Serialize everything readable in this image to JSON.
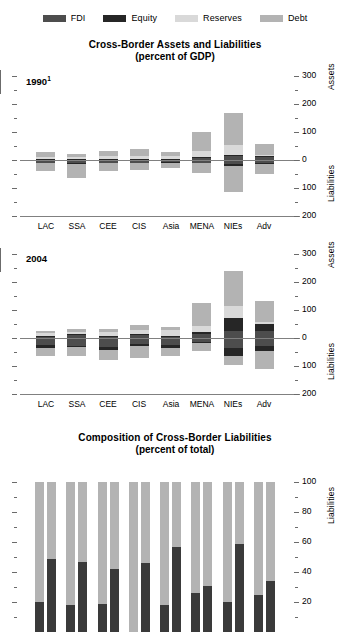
{
  "legend": {
    "items": [
      {
        "label": "FDI",
        "color": "#4d4d4d"
      },
      {
        "label": "Equity",
        "color": "#262626"
      },
      {
        "label": "Reserves",
        "color": "#d9d9d9"
      },
      {
        "label": "Debt",
        "color": "#b3b3b3"
      }
    ]
  },
  "chart_data": [
    {
      "type": "bar",
      "id": "assets-liabilities-1990",
      "title": "Cross-Border Assets and Liabilities",
      "subtitle": "(percent of GDP)",
      "panel_label": "1990",
      "panel_label_superscript": "1",
      "xlabel": "",
      "ylabel": "",
      "ylim": [
        -200,
        300
      ],
      "yticks": [
        -200,
        -100,
        0,
        100,
        200,
        300
      ],
      "ytick_labels": [
        "200",
        "100",
        "0",
        "100",
        "200",
        "300"
      ],
      "yminor_step": 50,
      "axis_side_labels": {
        "upper": "Assets",
        "lower": "Liabilities"
      },
      "grid": false,
      "legend_position": "top",
      "stacked": true,
      "categories": [
        "LAC",
        "SSA",
        "CEE",
        "CIS",
        "Asia",
        "MENA",
        "NIEs",
        "Adv"
      ],
      "series": [
        {
          "name": "FDI",
          "color": "#4d4d4d",
          "values_assets": [
            3,
            3,
            3,
            3,
            3,
            9,
            14,
            9
          ]
        },
        {
          "name": "Equity",
          "color": "#262626",
          "values_assets": [
            2,
            2,
            2,
            2,
            2,
            3,
            5,
            4
          ]
        },
        {
          "name": "Reserves",
          "color": "#d9d9d9",
          "values_assets": [
            7,
            5,
            8,
            9,
            9,
            19,
            36,
            6
          ]
        },
        {
          "name": "Debt",
          "color": "#b3b3b3",
          "values_assets": [
            16,
            13,
            20,
            24,
            16,
            69,
            113,
            38
          ]
        },
        {
          "name": "FDI",
          "color": "#4d4d4d",
          "values_liabilities": [
            9,
            12,
            9,
            9,
            7,
            9,
            16,
            9
          ]
        },
        {
          "name": "Equity",
          "color": "#262626",
          "values_liabilities": [
            3,
            3,
            3,
            2,
            3,
            3,
            6,
            4
          ]
        },
        {
          "name": "Debt",
          "color": "#b3b3b3",
          "values_liabilities": [
            26,
            49,
            29,
            26,
            18,
            34,
            92,
            37
          ]
        }
      ]
    },
    {
      "type": "bar",
      "id": "assets-liabilities-2004",
      "title": "Cross-Border Assets and Liabilities",
      "subtitle": "(percent of GDP)",
      "panel_label": "2004",
      "panel_label_superscript": "",
      "xlabel": "",
      "ylabel": "",
      "ylim": [
        -200,
        300
      ],
      "yticks": [
        -200,
        -100,
        0,
        100,
        200,
        300
      ],
      "ytick_labels": [
        "200",
        "100",
        "0",
        "100",
        "200",
        "300"
      ],
      "yminor_step": 50,
      "axis_side_labels": {
        "upper": "Assets",
        "lower": "Liabilities"
      },
      "grid": false,
      "legend_position": "top",
      "stacked": true,
      "categories": [
        "LAC",
        "SSA",
        "CEE",
        "CIS",
        "Asia",
        "MENA",
        "NIEs",
        "Adv"
      ],
      "series": [
        {
          "name": "FDI",
          "color": "#4d4d4d",
          "values_assets": [
            5,
            9,
            5,
            9,
            5,
            14,
            25,
            25
          ]
        },
        {
          "name": "Equity",
          "color": "#262626",
          "values_assets": [
            3,
            4,
            3,
            4,
            3,
            9,
            45,
            25
          ]
        },
        {
          "name": "Reserves",
          "color": "#d9d9d9",
          "values_assets": [
            9,
            9,
            12,
            14,
            20,
            19,
            45,
            6
          ]
        },
        {
          "name": "Debt",
          "color": "#b3b3b3",
          "values_assets": [
            8,
            11,
            13,
            20,
            13,
            82,
            123,
            75
          ]
        },
        {
          "name": "FDI",
          "color": "#4d4d4d",
          "values_liabilities": [
            26,
            27,
            33,
            22,
            26,
            13,
            35,
            28
          ]
        },
        {
          "name": "Equity",
          "color": "#262626",
          "values_liabilities": [
            9,
            6,
            9,
            7,
            10,
            6,
            31,
            20
          ]
        },
        {
          "name": "Debt",
          "color": "#b3b3b3",
          "values_liabilities": [
            31,
            31,
            35,
            42,
            28,
            26,
            30,
            62
          ]
        }
      ]
    },
    {
      "type": "bar",
      "id": "composition-of-liabilities",
      "title": "Composition of Cross-Border Liabilities",
      "subtitle": "(percent of total)",
      "xlabel": "",
      "ylabel": "",
      "ylim": [
        0,
        100
      ],
      "yticks": [
        20,
        40,
        60,
        80,
        100
      ],
      "ytick_labels": [
        "20",
        "40",
        "60",
        "80",
        "100"
      ],
      "yminor_step": 10,
      "axis_side_labels": {
        "upper": "",
        "lower": "Liabilities"
      },
      "grid": false,
      "stacked": true,
      "paired": true,
      "pair_names": [
        "1990",
        "2004"
      ],
      "categories": [
        "LAC",
        "SSA",
        "CEE",
        "CIS",
        "Asia",
        "MENA",
        "NIEs",
        "Adv"
      ],
      "series": [
        {
          "name": "Equity+FDI",
          "color": "#3a3a3a",
          "values_1990": [
            20,
            18,
            19,
            0,
            18,
            26,
            20,
            25
          ],
          "values_2004": [
            49,
            47,
            42,
            46,
            57,
            31,
            59,
            34
          ]
        },
        {
          "name": "Debt",
          "color": "#b3b3b3",
          "values_1990": [
            80,
            82,
            81,
            100,
            82,
            74,
            80,
            75
          ],
          "values_2004": [
            51,
            53,
            58,
            54,
            43,
            69,
            41,
            66
          ]
        }
      ]
    }
  ]
}
